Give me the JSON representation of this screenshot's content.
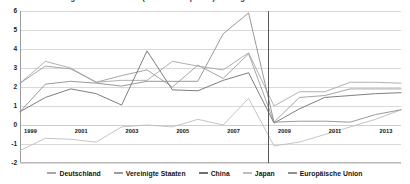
{
  "chart_data": {
    "type": "line",
    "title": "Entwicklung der Inflationsrate (Verbraucherpreise) im Vergleich",
    "xlabel": "",
    "ylabel": "",
    "ylim": [
      -2,
      6
    ],
    "xlim": [
      1999,
      2014
    ],
    "grid": true,
    "legend_position": "bottom",
    "y_ticks": [
      "6",
      "5",
      "4",
      "3",
      "2",
      "1",
      "0",
      "-1",
      "-2"
    ],
    "y_tick_values": [
      6,
      5,
      4,
      3,
      2,
      1,
      0,
      -1,
      -2
    ],
    "x": [
      1999,
      2000,
      2001,
      2002,
      2003,
      2004,
      2005,
      2006,
      2007,
      2008,
      2009,
      2010,
      2011,
      2012,
      2013,
      2014
    ],
    "x_tick_labels": [
      "1999",
      "2001",
      "2003",
      "2005",
      "2007",
      "2009",
      "2011",
      "2013"
    ],
    "x_tick_values": [
      1999,
      2001,
      2003,
      2005,
      2007,
      2009,
      2011,
      2013
    ],
    "annotations": [
      {
        "name": "crisis-marker",
        "type": "vline",
        "x": 2008.75,
        "color": "#58585a"
      }
    ],
    "series": [
      {
        "name": "Deutschland",
        "color": "#a8a8a8",
        "values": [
          2.2,
          3.35,
          3.0,
          2.25,
          2.35,
          2.35,
          3.35,
          3.1,
          2.9,
          3.8,
          1.0,
          1.75,
          1.75,
          2.25,
          2.25,
          2.2
        ]
      },
      {
        "name": "Vereinigte Staaten",
        "color": "#9c9c9c",
        "values": [
          2.2,
          3.1,
          2.95,
          2.25,
          2.6,
          2.9,
          2.0,
          3.15,
          2.45,
          3.75,
          0.15,
          1.45,
          1.55,
          1.9,
          1.9,
          1.9
        ]
      },
      {
        "name": "China",
        "color": "#6f6f6f",
        "values": [
          0.7,
          1.45,
          1.9,
          1.65,
          1.05,
          3.9,
          1.85,
          1.8,
          2.35,
          2.75,
          0.1,
          0.85,
          1.45,
          1.55,
          1.65,
          1.7
        ]
      },
      {
        "name": "Japan",
        "color": "#bdbdbd",
        "values": [
          -1.35,
          -0.7,
          -0.75,
          -0.9,
          -0.1,
          0.0,
          -0.1,
          0.3,
          0.0,
          1.4,
          -1.1,
          -0.9,
          -0.5,
          -0.1,
          0.3,
          0.8
        ]
      },
      {
        "name": "Europäische Union",
        "color": "#8f8f8f",
        "values": [
          0.7,
          2.15,
          2.3,
          2.2,
          2.05,
          2.3,
          2.3,
          2.3,
          4.8,
          5.9,
          0.15,
          0.2,
          0.2,
          0.15,
          0.55,
          0.8
        ]
      }
    ]
  },
  "legend": {
    "items": [
      {
        "label": "Deutschland",
        "color": "#a8a8a8"
      },
      {
        "label": "Vereinigte Staaten",
        "color": "#9c9c9c"
      },
      {
        "label": "China",
        "color": "#6f6f6f"
      },
      {
        "label": "Japan",
        "color": "#bdbdbd"
      },
      {
        "label": "Europäische Union",
        "color": "#8f8f8f"
      }
    ]
  }
}
